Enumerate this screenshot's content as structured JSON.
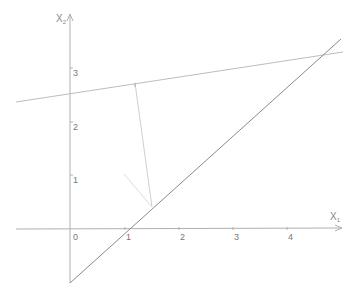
{
  "diagram": {
    "type": "geometry-plot",
    "axes": {
      "x_label": "X",
      "x_subscript": "1",
      "y_label": "X",
      "y_subscript": "2",
      "origin_label": "0",
      "x_ticks": [
        "1",
        "2",
        "3",
        "4"
      ],
      "y_ticks": [
        "1",
        "2",
        "3"
      ]
    },
    "lines": [
      {
        "name": "line-through-1-0",
        "description": "line x2 = x1 - 1",
        "from": [
          0,
          -1
        ],
        "to": [
          4.9,
          3.5
        ]
      },
      {
        "name": "near-horizontal-line",
        "description": "line with small positive slope through (0, 2.55)",
        "from": [
          -1,
          2.45
        ],
        "to": [
          5.0,
          3.35
        ]
      },
      {
        "name": "projection-segment",
        "description": "segment from upper line to lower line",
        "from": [
          1.2,
          2.8
        ],
        "to": [
          1.52,
          0.42
        ]
      },
      {
        "name": "short-segment",
        "description": "short faint segment ending at projection foot",
        "from": [
          1.0,
          1.0
        ],
        "to": [
          1.52,
          0.42
        ]
      }
    ],
    "colors": {
      "axis": "#aaaaaa",
      "main_line": "#888888",
      "upper_line": "#bbbbbb",
      "projection": "#cccccc",
      "text": "#777777"
    }
  }
}
